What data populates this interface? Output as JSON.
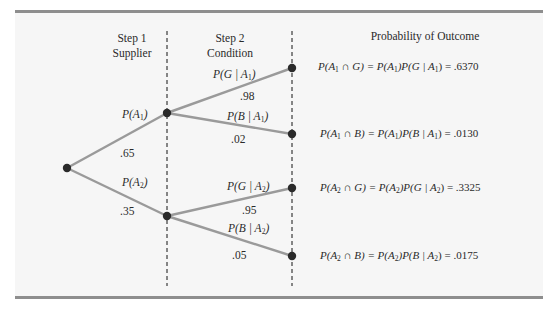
{
  "headers": {
    "step1_line1": "Step 1",
    "step1_line2": "Supplier",
    "step2_line1": "Step 2",
    "step2_line2": "Condition",
    "outcome": "Probability of Outcome"
  },
  "colors": {
    "branch": "#9a9a9a",
    "node": "#2a2a2a",
    "dash": "#3a3a3a",
    "rule": "#8e8e8e",
    "background": "#f6f6f6"
  },
  "nodes": {
    "root": {
      "x": 67,
      "y": 168
    },
    "A1": {
      "x": 167,
      "y": 113
    },
    "A2": {
      "x": 167,
      "y": 216
    },
    "A1G": {
      "x": 292,
      "y": 68
    },
    "A1B": {
      "x": 292,
      "y": 134
    },
    "A2G": {
      "x": 292,
      "y": 188
    },
    "A2B": {
      "x": 292,
      "y": 256
    }
  },
  "branches": {
    "A1": {
      "label_p": "P(",
      "label_var": "A",
      "label_sub": "1",
      "label_close": ")",
      "value": ".65"
    },
    "A2": {
      "label_p": "P(",
      "label_var": "A",
      "label_sub": "2",
      "label_close": ")",
      "value": ".35"
    },
    "G_A1": {
      "label_p": "P(",
      "label_var": "G | A",
      "label_sub": "1",
      "label_close": ")",
      "value": ".98"
    },
    "B_A1": {
      "label_p": "P(",
      "label_var": "B | A",
      "label_sub": "1",
      "label_close": ")",
      "value": ".02"
    },
    "G_A2": {
      "label_p": "P(",
      "label_var": "G | A",
      "label_sub": "2",
      "label_close": ")",
      "value": ".95"
    },
    "B_A2": {
      "label_p": "P(",
      "label_var": "B | A",
      "label_sub": "2",
      "label_close": ")",
      "value": ".05"
    }
  },
  "outcomes": [
    {
      "a": "P(A",
      "sub1": "1",
      "b": " ∩ G) = P(A",
      "sub2": "1",
      "c": ")P(G | A",
      "sub3": "1",
      "d": ") = ",
      "value": ".6370"
    },
    {
      "a": "P(A",
      "sub1": "1",
      "b": " ∩ B) = P(A",
      "sub2": "1",
      "c": ")P(B | A",
      "sub3": "1",
      "d": ") = ",
      "value": ".0130"
    },
    {
      "a": "P(A",
      "sub1": "2",
      "b": " ∩ G) = P(A",
      "sub2": "2",
      "c": ")P(G | A",
      "sub3": "2",
      "d": ") = ",
      "value": ".3325"
    },
    {
      "a": "P(A",
      "sub1": "2",
      "b": " ∩ B) = P(A",
      "sub2": "2",
      "c": ")P(B | A",
      "sub3": "2",
      "d": ") = ",
      "value": ".0175"
    }
  ]
}
